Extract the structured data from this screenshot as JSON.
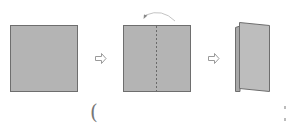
{
  "diagram": {
    "type": "paper-folding-instructions",
    "steps": [
      {
        "id": 1,
        "description": "flat square sheet of paper"
      },
      {
        "id": 2,
        "description": "square sheet with dashed vertical center fold line and curved arrow indicating fold right half over to the left"
      },
      {
        "id": 3,
        "description": "sheet folded in half into a standing card"
      }
    ],
    "arrows": [
      {
        "from": 1,
        "to": 2,
        "glyph": "⇨"
      },
      {
        "from": 2,
        "to": 3,
        "glyph": "⇨"
      }
    ],
    "colors": {
      "paper_fill": "#b4b4b4",
      "paper_fill_front": "#bdbdbd",
      "paper_edge": "#6e6e6e",
      "fold_line": "#6a6a6a",
      "arrow_stroke": "#9a9a9a",
      "curved_arrow": "#bfbfbf",
      "background": "#ffffff"
    },
    "footer": {
      "paren_text": "("
    }
  }
}
